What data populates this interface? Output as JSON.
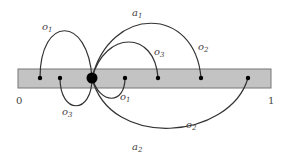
{
  "diagram": {
    "bar": {
      "x": 18,
      "y": 69,
      "width": 253,
      "height": 19,
      "fill": "#c3c3c3",
      "stroke": "#777777"
    },
    "axis_labels": [
      {
        "text": "0",
        "x": 16,
        "y": 104
      },
      {
        "text": "1",
        "x": 268,
        "y": 104
      }
    ],
    "points": [
      {
        "id": "p1",
        "x": 40,
        "y": 78,
        "r": 2.2
      },
      {
        "id": "p2",
        "x": 60,
        "y": 78,
        "r": 2.2
      },
      {
        "id": "center",
        "x": 92,
        "y": 78,
        "r": 5.5
      },
      {
        "id": "p4",
        "x": 125,
        "y": 78,
        "r": 2.2
      },
      {
        "id": "p5",
        "x": 158,
        "y": 78,
        "r": 2.2
      },
      {
        "id": "p6",
        "x": 201,
        "y": 78,
        "r": 2.2
      },
      {
        "id": "p7",
        "x": 248,
        "y": 78,
        "r": 2.2
      }
    ],
    "arcs": [
      {
        "name": "arc-o1-top",
        "d": "M40 78 C40 15, 88 15, 92 78"
      },
      {
        "name": "arc-a1-top",
        "d": "M92 78 C110 5, 195 5, 201 78"
      },
      {
        "name": "arc-o3-top",
        "d": "M92 78 C105 30, 155 30, 158 78"
      },
      {
        "name": "arc-o3-bottom",
        "d": "M60 78 C60 115, 92 115, 92 78"
      },
      {
        "name": "arc-o1-bottom",
        "d": "M92 78 C100 105, 125 105, 125 78"
      },
      {
        "name": "arc-a2-o2-bottom",
        "d": "M92 78 C110 150, 230 140, 248 78"
      }
    ],
    "labels": [
      {
        "base": "o",
        "sub": "1",
        "x": 42,
        "y": 30
      },
      {
        "base": "a",
        "sub": "1",
        "x": 132,
        "y": 16
      },
      {
        "base": "o",
        "sub": "3",
        "x": 154,
        "y": 55
      },
      {
        "base": "o",
        "sub": "2",
        "x": 198,
        "y": 50
      },
      {
        "base": "o",
        "sub": "3",
        "x": 62,
        "y": 115
      },
      {
        "base": "o",
        "sub": "1",
        "x": 120,
        "y": 100
      },
      {
        "base": "o",
        "sub": "2",
        "x": 186,
        "y": 128
      },
      {
        "base": "a",
        "sub": "2",
        "x": 132,
        "y": 150
      }
    ]
  }
}
